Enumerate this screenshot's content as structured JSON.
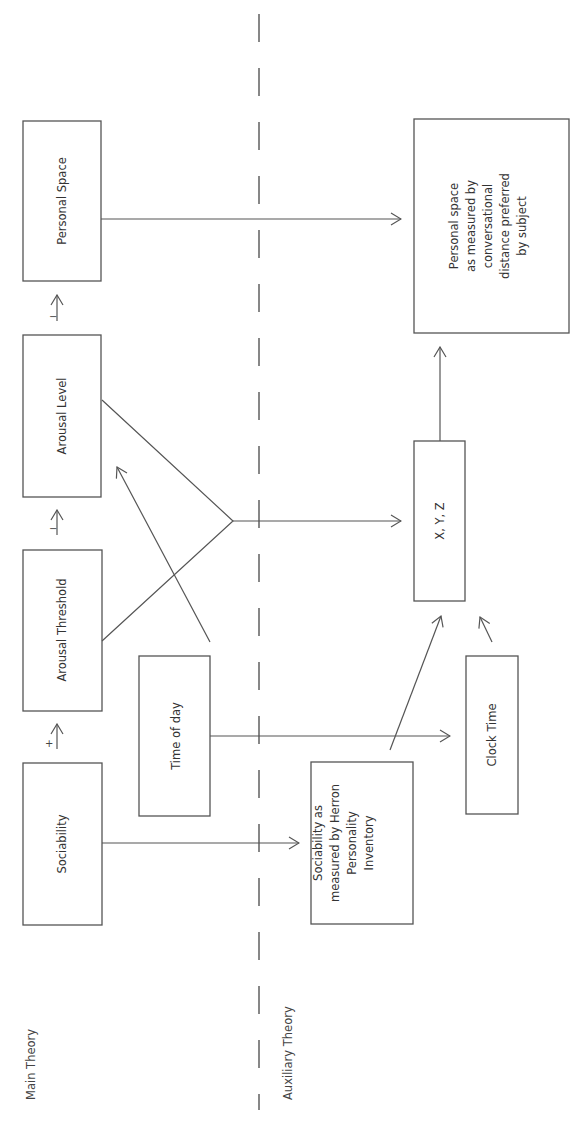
{
  "diagram": {
    "sections": {
      "main": "Main Theory",
      "auxiliary": "Auxiliary Theory"
    },
    "main_theory": {
      "sociability": "Sociability",
      "arousal_threshold": "Arousal Threshold",
      "arousal_level": "Arousal Level",
      "personal_space": "Personal Space",
      "time_of_day": "Time of day",
      "signs": {
        "sociability_to_threshold": "+",
        "threshold_to_level": "−",
        "level_to_space": "−"
      }
    },
    "auxiliary_theory": {
      "sociability_measured": [
        "Sociability as",
        "measured by Herron",
        "Personality",
        "Inventory"
      ],
      "clock_time": "Clock Time",
      "xyz": "X, Y, Z",
      "personal_space_measured": [
        "Personal space",
        "as measured by",
        "conversational",
        "distance preferred",
        "by subject"
      ]
    }
  }
}
